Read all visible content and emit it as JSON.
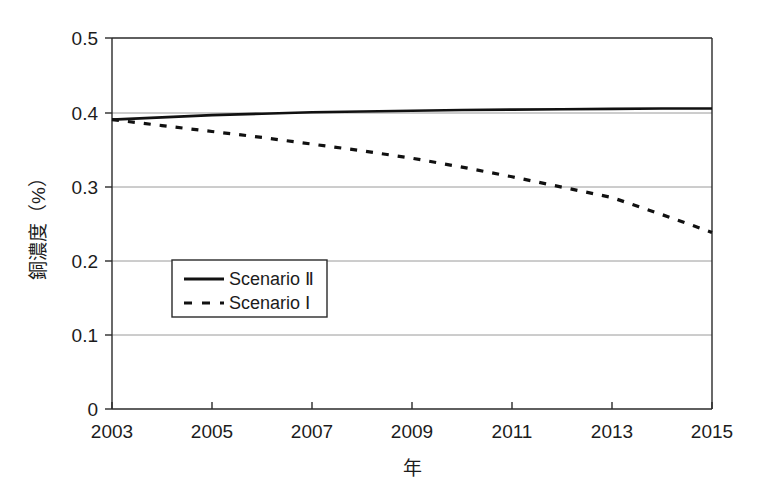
{
  "chart_data": {
    "type": "line",
    "title": "",
    "xlabel": "年",
    "ylabel": "銅濃度（%）",
    "xlim": [
      2003,
      2015
    ],
    "ylim": [
      0,
      0.5
    ],
    "grid": "horizontal",
    "legend_position": "inside-left-lower",
    "x_tick_labels": [
      "2003",
      "2005",
      "2007",
      "2009",
      "2011",
      "2013",
      "2015"
    ],
    "x_ticks": [
      2003,
      2005,
      2007,
      2009,
      2011,
      2013,
      2015
    ],
    "y_tick_labels": [
      "0",
      "0.1",
      "0.2",
      "0.3",
      "0.4",
      "0.5"
    ],
    "y_ticks": [
      0,
      0.1,
      0.2,
      0.3,
      0.4,
      0.5
    ],
    "x": [
      2003,
      2004,
      2005,
      2006,
      2007,
      2008,
      2009,
      2010,
      2011,
      2012,
      2013,
      2014,
      2015
    ],
    "series": [
      {
        "name": "Scenario Ⅱ",
        "style": "solid",
        "color": "#111111",
        "values": [
          0.39,
          0.393,
          0.396,
          0.398,
          0.4,
          0.401,
          0.402,
          0.403,
          0.4035,
          0.404,
          0.4045,
          0.405,
          0.405
        ]
      },
      {
        "name": "Scenario Ⅰ",
        "style": "dashed",
        "color": "#111111",
        "values": [
          0.39,
          0.382,
          0.374,
          0.366,
          0.357,
          0.348,
          0.338,
          0.326,
          0.313,
          0.299,
          0.285,
          0.262,
          0.238
        ]
      }
    ],
    "annotations": [
      "Scenario I crosses 0.3 at approximately 2011.3",
      "Scenario II remains nearly flat just above 0.4"
    ]
  },
  "legend": {
    "entries": [
      {
        "label": "Scenario Ⅱ",
        "style": "solid"
      },
      {
        "label": "Scenario Ⅰ",
        "style": "dashed"
      }
    ]
  },
  "axes": {
    "y_axis_title": "銅濃度（%）",
    "x_axis_title": "年"
  }
}
